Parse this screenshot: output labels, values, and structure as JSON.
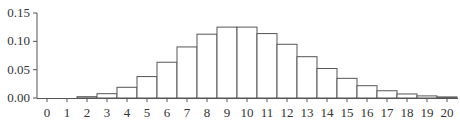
{
  "chart_data": {
    "type": "bar",
    "title": "",
    "xlabel": "",
    "ylabel": "",
    "categories": [
      "0",
      "1",
      "2",
      "3",
      "4",
      "5",
      "6",
      "7",
      "8",
      "9",
      "10",
      "11",
      "12",
      "13",
      "14",
      "15",
      "16",
      "17",
      "18",
      "19",
      "20"
    ],
    "values": [
      0.0,
      0.0005,
      0.0023,
      0.0076,
      0.0189,
      0.0378,
      0.0631,
      0.0901,
      0.1126,
      0.1251,
      0.1251,
      0.1137,
      0.0948,
      0.0729,
      0.0521,
      0.0347,
      0.0217,
      0.0128,
      0.0071,
      0.0037,
      0.0019
    ],
    "ylim": [
      0,
      0.15
    ],
    "yticks": [
      "0.00",
      "0.05",
      "0.10",
      "0.15"
    ],
    "ytick_values": [
      0,
      0.05,
      0.1,
      0.15
    ],
    "grid": false,
    "bar_fill": "#ffffff",
    "bar_stroke": "#555555"
  }
}
